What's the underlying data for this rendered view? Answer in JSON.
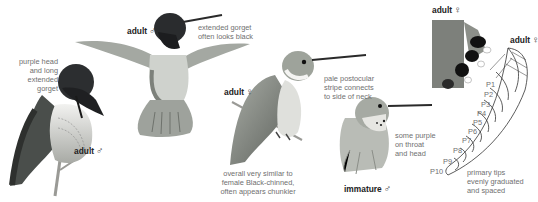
{
  "plate": {
    "figures": [
      {
        "id": "perched-adult-male",
        "label": "adult",
        "sex_symbol": "♂",
        "note": "purple head\nand long\nextended\ngorget"
      },
      {
        "id": "hovering-adult-male",
        "label": "adult",
        "sex_symbol": "♂",
        "note": "extended gorget\noften looks black"
      },
      {
        "id": "perched-adult-female",
        "label": "adult",
        "sex_symbol": "♀",
        "note_head": "pale postocular\nstripe connects\nto side of neck",
        "note_body": "overall very similar to\nfemale Black-chinned,\noften appears chunkier"
      },
      {
        "id": "immature-male",
        "label": "immature",
        "sex_symbol": "♂",
        "note": "some purple\non throat\nand head"
      },
      {
        "id": "tail-adult-female",
        "label": "adult",
        "sex_symbol": "♀"
      },
      {
        "id": "wing-adult-female",
        "label": "adult",
        "sex_symbol": "♀",
        "primaries": [
          "P1",
          "P2",
          "P3",
          "P4",
          "P5",
          "P6",
          "P7",
          "P8",
          "P9",
          "P10"
        ],
        "note": "primary tips\nevenly graduated\nand spaced"
      }
    ]
  },
  "colors": {
    "background": "#ffffff",
    "note_text": "#6f6f6f",
    "label_text": "#222222"
  }
}
